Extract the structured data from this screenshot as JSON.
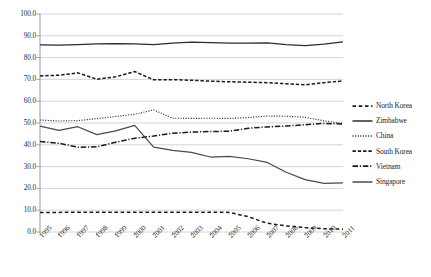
{
  "chart_data": {
    "type": "line",
    "title": "",
    "subtitle": "",
    "xlabel": "",
    "ylabel": "",
    "xlim": [
      1995,
      2011
    ],
    "ylim": [
      0.0,
      100.0
    ],
    "ytick_step": 10.0,
    "grid": "horizontal",
    "legend_position": "right",
    "categories": [
      "1995",
      "1996",
      "1997",
      "1998",
      "1999",
      "2000",
      "2001",
      "2002",
      "2003",
      "2004",
      "2005",
      "2006",
      "2007",
      "2008",
      "2009",
      "2010",
      "2011"
    ],
    "x": [
      1995,
      1996,
      1997,
      1998,
      1999,
      2000,
      2001,
      2002,
      2003,
      2004,
      2005,
      2006,
      2007,
      2008,
      2009,
      2010,
      2011
    ],
    "ytick_labels": [
      "0.0",
      "10.0",
      "20.0",
      "30.0",
      "40.0",
      "50.0",
      "60.0",
      "70.0",
      "80.0",
      "90.0",
      "100.0"
    ],
    "ytick_values": [
      0.0,
      10.0,
      20.0,
      30.0,
      40.0,
      50.0,
      60.0,
      70.0,
      80.0,
      90.0,
      100.0
    ],
    "series": [
      {
        "name": "North Korea",
        "style": "dash-dot-long",
        "color": "#1a1a1a",
        "values": [
          9.0,
          9.0,
          9.1,
          9.1,
          9.1,
          9.1,
          9.1,
          9.1,
          9.1,
          9.1,
          9.0,
          7.0,
          4.0,
          2.8,
          2.0,
          1.5,
          1.3
        ]
      },
      {
        "name": "Zimbabwe",
        "style": "solid",
        "color": "#2b2b2b",
        "values": [
          85.8,
          85.7,
          86.0,
          86.3,
          86.4,
          86.3,
          86.0,
          86.6,
          87.1,
          86.9,
          86.6,
          86.6,
          86.8,
          86.0,
          85.5,
          86.2,
          87.2
        ]
      },
      {
        "name": "China",
        "style": "dotted",
        "color": "#303030",
        "values": [
          51.4,
          50.9,
          51.1,
          52.0,
          53.0,
          54.0,
          56.0,
          52.2,
          52.1,
          52.2,
          52.1,
          52.5,
          53.2,
          53.1,
          52.6,
          51.0,
          49.8
        ]
      },
      {
        "name": "South Korea",
        "style": "dashed",
        "color": "#1a1a1a",
        "values": [
          71.6,
          71.9,
          73.0,
          70.1,
          71.2,
          73.6,
          69.8,
          69.9,
          69.6,
          69.2,
          68.9,
          68.7,
          68.5,
          68.0,
          67.5,
          68.5,
          69.3
        ]
      },
      {
        "name": "Vietnam",
        "style": "dash-dot",
        "color": "#1a1a1a",
        "values": [
          41.5,
          40.7,
          38.9,
          39.1,
          41.2,
          43.0,
          44.0,
          45.3,
          45.8,
          46.1,
          46.2,
          47.6,
          48.2,
          48.6,
          49.2,
          49.8,
          49.5
        ]
      },
      {
        "name": "Singapore",
        "style": "solid",
        "color": "#4a4a4a",
        "values": [
          48.6,
          46.6,
          48.3,
          44.7,
          46.4,
          48.9,
          38.9,
          37.4,
          36.5,
          34.4,
          34.7,
          33.6,
          31.9,
          27.4,
          24.0,
          22.3,
          22.5
        ]
      }
    ]
  },
  "legend": {
    "items": [
      {
        "label": "North Korea"
      },
      {
        "label": "Zimbabwe"
      },
      {
        "label": "China"
      },
      {
        "label": "South Korea"
      },
      {
        "label": "Vietnam"
      },
      {
        "label": "Singapore"
      }
    ]
  },
  "colors": {
    "grid": "#d0d0d0",
    "axis": "#9a9a9a",
    "text": "#222222",
    "plot_background": "#ffffff"
  }
}
